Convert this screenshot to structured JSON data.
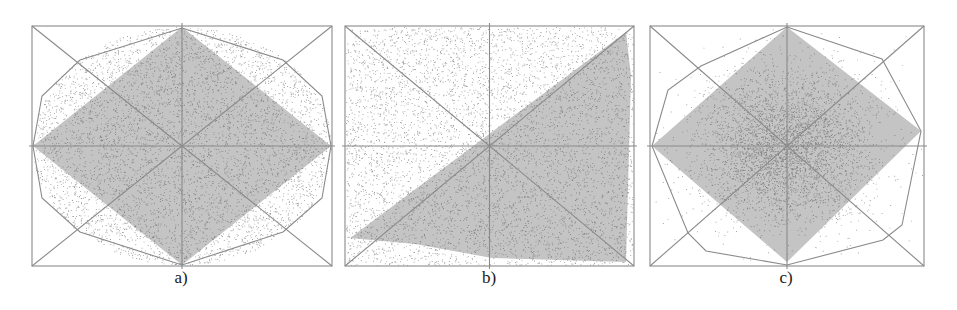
{
  "figure": {
    "background": "#ffffff",
    "frame_color": "#8a8a8a",
    "region_fill": "#c4c4c4",
    "point_color": "#505050",
    "panels": [
      {
        "id": "a",
        "label": "a)",
        "label_x": 181,
        "frame": {
          "x0": 32,
          "y0": 26,
          "x1": 332,
          "y1": 266
        },
        "description": "Uniform points in an ellipse; shaded diamond (rotated square) inscribed; octagon hull",
        "distribution": "ellipse-uniform",
        "point_count": 5200,
        "shaded_polygon": [
          [
            182,
            27
          ],
          [
            331,
            146
          ],
          [
            182,
            265
          ],
          [
            33,
            146
          ]
        ],
        "hull_polygon": [
          [
            182,
            28
          ],
          [
            283,
            60
          ],
          [
            322,
            96
          ],
          [
            331,
            146
          ],
          [
            322,
            198
          ],
          [
            283,
            232
          ],
          [
            182,
            265
          ],
          [
            80,
            232
          ],
          [
            42,
            198
          ],
          [
            33,
            146
          ],
          [
            42,
            96
          ],
          [
            80,
            60
          ]
        ]
      },
      {
        "id": "b",
        "label": "b)",
        "label_x": 489,
        "frame": {
          "x0": 345,
          "y0": 26,
          "x1": 634,
          "y1": 266
        },
        "description": "Uniform points in a rectangle; shaded triangle along the diagonal",
        "distribution": "rect-uniform",
        "point_count": 5600,
        "shaded_polygon": [
          [
            626,
            32
          ],
          [
            631,
            76
          ],
          [
            626,
            262
          ],
          [
            492,
            258
          ],
          [
            415,
            244
          ],
          [
            350,
            238
          ]
        ],
        "hull_polygon": []
      },
      {
        "id": "c",
        "label": "c)",
        "label_x": 786,
        "frame": {
          "x0": 650,
          "y0": 26,
          "x1": 924,
          "y1": 266
        },
        "description": "Gaussian-concentrated points; shaded diamond; octagon hull",
        "distribution": "gaussian",
        "point_count": 4200,
        "shaded_polygon": [
          [
            787,
            27
          ],
          [
            921,
            131
          ],
          [
            787,
            262
          ],
          [
            652,
            146
          ]
        ],
        "hull_polygon": [
          [
            787,
            27
          ],
          [
            882,
            59
          ],
          [
            921,
            131
          ],
          [
            902,
            225
          ],
          [
            883,
            240
          ],
          [
            787,
            265
          ],
          [
            706,
            251
          ],
          [
            688,
            233
          ],
          [
            652,
            146
          ],
          [
            668,
            90
          ],
          [
            701,
            66
          ]
        ]
      }
    ]
  }
}
